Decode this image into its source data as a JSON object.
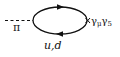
{
  "diagram": {
    "type": "feynman-diagram",
    "external_line": {
      "label": "π",
      "style": "dashed"
    },
    "loop": {
      "label": "u,d",
      "propagator_direction": "clockwise"
    },
    "vertex": {
      "label_gamma": "γ",
      "label_mu": "μ",
      "label_gamma2": "γ",
      "label_5": "5",
      "marker": "cross"
    },
    "colors": {
      "line": "#111111",
      "background": "#ffffff"
    }
  }
}
